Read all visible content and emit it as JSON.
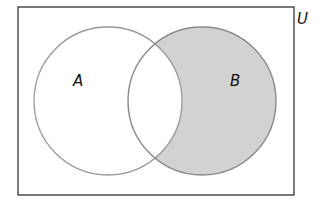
{
  "diagram": {
    "type": "venn",
    "universe": {
      "label": "U",
      "x": 18,
      "y": 7,
      "width": 276,
      "height": 188,
      "stroke": "#333333"
    },
    "sets": [
      {
        "label": "A",
        "cx": 108,
        "cy": 101,
        "r": 74,
        "label_x": 73,
        "label_y": 86,
        "stroke": "#999999"
      },
      {
        "label": "B",
        "cx": 202,
        "cy": 101,
        "r": 74,
        "label_x": 230,
        "label_y": 86,
        "stroke": "#8a8a8a"
      }
    ],
    "shaded_region": "B minus A",
    "shade_color": "#d2d2d2"
  }
}
